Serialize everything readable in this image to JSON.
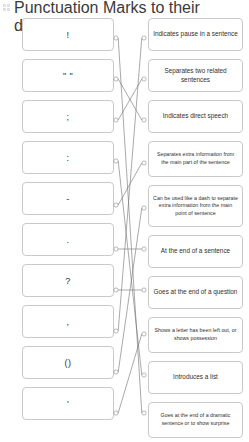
{
  "header": {
    "icon": "drag-handle-icon",
    "instruction": "Draw a line to match the Punctuation Marks to their definition."
  },
  "colors": {
    "card_border": "#c9c9c9",
    "line": "#6e6e6e",
    "node_stroke": "#8a8a8a",
    "text": "#2f2f2f",
    "background": "#ffffff"
  },
  "left_column": {
    "items": [
      {
        "label": "!",
        "name": "exclamation-mark"
      },
      {
        "label": "\" \"",
        "name": "quotation-marks"
      },
      {
        "label": ";",
        "name": "semicolon"
      },
      {
        "label": ":",
        "name": "colon"
      },
      {
        "label": "-",
        "name": "hyphen-dash"
      },
      {
        "label": ".",
        "name": "full-stop"
      },
      {
        "label": "?",
        "name": "question-mark"
      },
      {
        "label": ",",
        "name": "comma"
      },
      {
        "label": "()",
        "name": "brackets"
      },
      {
        "label": "'",
        "name": "apostrophe"
      }
    ]
  },
  "right_column": {
    "items": [
      {
        "label": "Indicates pause in a sentence",
        "name": "definition-pause",
        "size": "h33"
      },
      {
        "label": "Separates two related sentences",
        "name": "definition-separates-two",
        "size": "h33"
      },
      {
        "label": "Indicates direct speech",
        "name": "definition-direct-speech",
        "size": "h33"
      },
      {
        "label": "Separates extra information from the main part of the sentence",
        "name": "definition-extra-info",
        "size": "h36"
      },
      {
        "label": "Can be used like a dash to separate extra information from the main point of sentence",
        "name": "definition-like-a-dash",
        "size": "h42"
      },
      {
        "label": "At the end of a sentence",
        "name": "definition-end-of-sentence",
        "size": "h33"
      },
      {
        "label": "Goes at the end of a question",
        "name": "definition-end-of-question",
        "size": "h33"
      },
      {
        "label": "Shows a letter has been left out, or shows possession",
        "name": "definition-letter-left-out",
        "size": "h36"
      },
      {
        "label": "Introduces a list",
        "name": "definition-introduces-list",
        "size": "h33"
      },
      {
        "label": "Goes at the end of a dramatic sentence or to show surprise",
        "name": "definition-dramatic-sentence",
        "size": "h36"
      }
    ]
  },
  "connectors": {
    "left_nodes": [
      {
        "x": 116,
        "y": 38
      },
      {
        "x": 116,
        "y": 79
      },
      {
        "x": 116,
        "y": 120
      },
      {
        "x": 116,
        "y": 161
      },
      {
        "x": 116,
        "y": 205
      },
      {
        "x": 116,
        "y": 249
      },
      {
        "x": 116,
        "y": 290
      },
      {
        "x": 116,
        "y": 331
      },
      {
        "x": 116,
        "y": 372
      },
      {
        "x": 116,
        "y": 413
      }
    ],
    "right_nodes": [
      {
        "x": 144,
        "y": 38
      },
      {
        "x": 144,
        "y": 79
      },
      {
        "x": 144,
        "y": 120
      },
      {
        "x": 144,
        "y": 163
      },
      {
        "x": 144,
        "y": 208
      },
      {
        "x": 144,
        "y": 249
      },
      {
        "x": 144,
        "y": 290
      },
      {
        "x": 144,
        "y": 334
      },
      {
        "x": 144,
        "y": 375
      },
      {
        "x": 144,
        "y": 413
      }
    ],
    "links": [
      {
        "from": 0,
        "to": 9,
        "name": "link-exclamation-to-dramatic"
      },
      {
        "from": 1,
        "to": 2,
        "name": "link-quotation-to-direct-speech"
      },
      {
        "from": 2,
        "to": 1,
        "name": "link-semicolon-to-separates-two"
      },
      {
        "from": 3,
        "to": 8,
        "name": "link-colon-to-introduces-list"
      },
      {
        "from": 4,
        "to": 3,
        "name": "link-dash-to-extra-info"
      },
      {
        "from": 5,
        "to": 5,
        "name": "link-fullstop-to-end-of-sentence"
      },
      {
        "from": 6,
        "to": 6,
        "name": "link-question-to-end-of-question"
      },
      {
        "from": 7,
        "to": 0,
        "name": "link-comma-to-pause"
      },
      {
        "from": 8,
        "to": 4,
        "name": "link-brackets-to-like-a-dash"
      },
      {
        "from": 9,
        "to": 7,
        "name": "link-apostrophe-to-letter-left-out"
      }
    ]
  }
}
